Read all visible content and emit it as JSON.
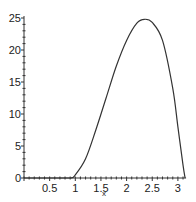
{
  "chart_data": {
    "type": "line",
    "title": "",
    "xlabel": "x",
    "ylabel": "",
    "xlim": [
      0,
      3.14
    ],
    "ylim": [
      0,
      25
    ],
    "grid": false,
    "legend": null,
    "x_ticks": [
      "0.5",
      "1",
      "1.5",
      "2",
      "2.5",
      "3"
    ],
    "x_tick_values": [
      0.5,
      1,
      1.5,
      2,
      2.5,
      3
    ],
    "y_ticks": [
      "0",
      "5",
      "10",
      "15",
      "20",
      "25"
    ],
    "y_tick_values": [
      0,
      5,
      10,
      15,
      20,
      25
    ],
    "series": [
      {
        "name": "curve",
        "color": "#333333",
        "x": [
          0,
          0.5,
          0.9,
          1.0,
          1.2,
          1.4,
          1.6,
          1.8,
          2.0,
          2.2,
          2.35,
          2.5,
          2.7,
          2.9,
          3.0,
          3.1,
          3.14
        ],
        "y": [
          0,
          0,
          0,
          0.5,
          3,
          7.5,
          12.5,
          17.5,
          21.5,
          24.2,
          24.8,
          24.3,
          21.5,
          14,
          8,
          2,
          0
        ]
      }
    ]
  }
}
